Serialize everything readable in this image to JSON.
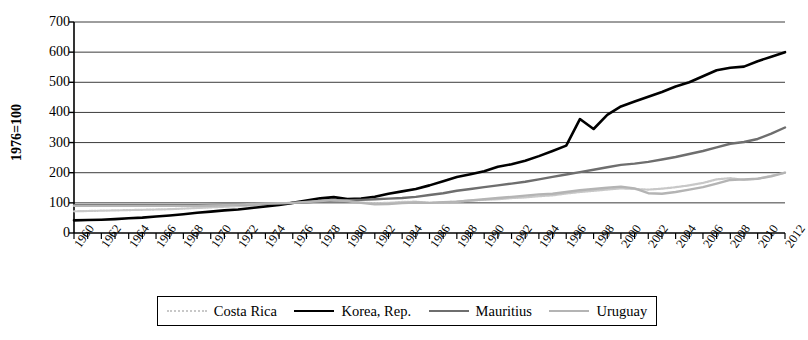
{
  "chart_data": {
    "type": "line",
    "title": "",
    "xlabel": "",
    "ylabel": "1976=100",
    "xlim": [
      1960,
      2012
    ],
    "ylim": [
      0,
      700
    ],
    "ytick_step": 100,
    "xtick_step": 2,
    "xtick_minor_step": 1,
    "grid": "horizontal",
    "legend_position": "bottom",
    "yticks": [
      0,
      100,
      200,
      300,
      400,
      500,
      600,
      700
    ],
    "xticks": [
      1960,
      1962,
      1964,
      1966,
      1968,
      1970,
      1972,
      1974,
      1976,
      1978,
      1980,
      1982,
      1984,
      1986,
      1988,
      1990,
      1992,
      1994,
      1996,
      1998,
      2000,
      2002,
      2004,
      2006,
      2008,
      2010,
      2012
    ],
    "x": [
      1960,
      1961,
      1962,
      1963,
      1964,
      1965,
      1966,
      1967,
      1968,
      1969,
      1970,
      1971,
      1972,
      1973,
      1974,
      1975,
      1976,
      1977,
      1978,
      1979,
      1980,
      1981,
      1982,
      1983,
      1984,
      1985,
      1986,
      1987,
      1988,
      1989,
      1990,
      1991,
      1992,
      1993,
      1994,
      1995,
      1996,
      1997,
      1998,
      1999,
      2000,
      2001,
      2002,
      2003,
      2004,
      2005,
      2006,
      2007,
      2008,
      2009,
      2010,
      2011,
      2012
    ],
    "series": [
      {
        "name": "Costa Rica",
        "color": "#c8c8c8",
        "width": 2.2,
        "style": "dotted-light",
        "values": [
          72,
          73,
          74,
          75,
          76,
          77,
          78,
          79,
          81,
          83,
          85,
          87,
          89,
          91,
          94,
          97,
          100,
          104,
          108,
          110,
          107,
          101,
          99,
          100,
          103,
          104,
          100,
          102,
          104,
          108,
          110,
          112,
          116,
          118,
          122,
          125,
          131,
          136,
          140,
          144,
          148,
          146,
          144,
          147,
          152,
          158,
          166,
          178,
          182,
          176,
          180,
          190,
          200
        ]
      },
      {
        "name": "Korea, Rep.",
        "color": "#000000",
        "width": 2.6,
        "style": "solid-heavy",
        "values": [
          42,
          43,
          44,
          46,
          49,
          51,
          55,
          58,
          62,
          67,
          71,
          75,
          78,
          83,
          88,
          93,
          100,
          108,
          115,
          119,
          113,
          114,
          120,
          130,
          138,
          146,
          158,
          172,
          186,
          195,
          205,
          220,
          228,
          240,
          255,
          272,
          290,
          378,
          345,
          392,
          420,
          436,
          452,
          468,
          486,
          500,
          520,
          540,
          548,
          552,
          570,
          585,
          600
        ]
      },
      {
        "name": "Mauritius",
        "color": "#6e6e6e",
        "width": 2.4,
        "style": "solid-medium",
        "values": [
          92,
          92,
          92,
          92,
          92,
          92,
          92,
          92,
          92,
          92,
          93,
          94,
          95,
          96,
          97,
          98,
          100,
          102,
          105,
          108,
          109,
          110,
          112,
          114,
          116,
          120,
          126,
          132,
          140,
          146,
          152,
          158,
          164,
          170,
          178,
          186,
          194,
          202,
          210,
          218,
          226,
          230,
          236,
          244,
          252,
          262,
          272,
          284,
          296,
          302,
          312,
          330,
          350
        ]
      },
      {
        "name": "Uruguay",
        "color": "#b4b4b4",
        "width": 2.4,
        "style": "solid-light",
        "values": [
          90,
          90,
          90,
          90,
          90,
          90,
          90,
          90,
          90,
          90,
          91,
          92,
          94,
          96,
          98,
          99,
          100,
          103,
          106,
          109,
          106,
          100,
          95,
          96,
          99,
          101,
          100,
          102,
          104,
          108,
          112,
          116,
          120,
          124,
          128,
          130,
          136,
          142,
          146,
          150,
          154,
          148,
          132,
          130,
          136,
          144,
          152,
          164,
          176,
          178,
          180,
          188,
          200
        ]
      }
    ]
  },
  "legend": {
    "items": [
      {
        "label": "Costa Rica"
      },
      {
        "label": "Korea, Rep."
      },
      {
        "label": "Mauritius"
      },
      {
        "label": "Uruguay"
      }
    ]
  }
}
